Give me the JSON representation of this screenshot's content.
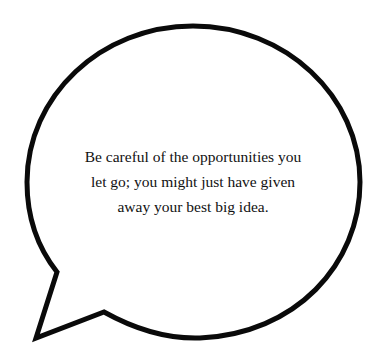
{
  "speech_bubble": {
    "shape": "speech-bubble-with-tail-bottom-left",
    "stroke_color": "#0a0a0a",
    "fill_color": "#ffffff",
    "quote_lines": [
      "Be careful of the opportunities you",
      "let go; you might just have given",
      "away your best big idea."
    ]
  }
}
